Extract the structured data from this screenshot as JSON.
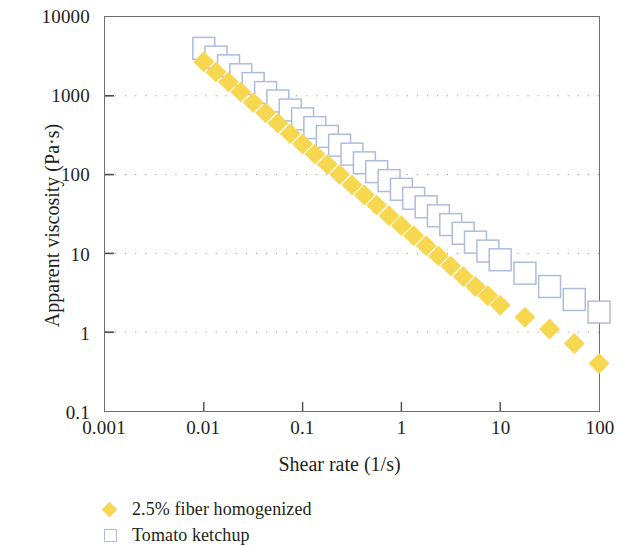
{
  "chart_data": {
    "type": "scatter",
    "title": "",
    "xlabel": "Shear rate (1/s)",
    "ylabel": "Apparent viscosity (Pa·s)",
    "xscale": "log",
    "yscale": "log",
    "xlim": [
      0.001,
      100
    ],
    "ylim": [
      0.1,
      10000
    ],
    "xticks": [
      "0.001",
      "0.01",
      "0.1",
      "1",
      "10",
      "100"
    ],
    "xtick_values": [
      0.001,
      0.01,
      0.1,
      1,
      10,
      100
    ],
    "yticks": [
      "10000",
      "1000",
      "100",
      "10",
      "1",
      "0.1"
    ],
    "ytick_values": [
      10000,
      1000,
      100,
      10,
      1,
      0.1
    ],
    "grid": "horizontal-dotted",
    "legend_position": "below-left",
    "series": [
      {
        "name": "2.5% fiber homogenized",
        "marker": "filled-diamond",
        "color": "#F7D74F",
        "x": [
          0.01,
          0.0133,
          0.0178,
          0.0237,
          0.0316,
          0.0422,
          0.0562,
          0.075,
          0.1,
          0.133,
          0.178,
          0.237,
          0.316,
          0.422,
          0.562,
          0.75,
          1.0,
          1.33,
          1.78,
          2.37,
          3.16,
          4.22,
          5.62,
          7.5,
          10.0,
          17.8,
          31.6,
          56.2,
          100.0
        ],
        "y": [
          2700,
          2000,
          1500,
          1120,
          820,
          610,
          450,
          330,
          245,
          182,
          135,
          100,
          74,
          55,
          41,
          30,
          22.5,
          16.8,
          12.5,
          9.3,
          6.9,
          5.1,
          3.8,
          2.9,
          2.2,
          1.55,
          1.1,
          0.72,
          0.4
        ]
      },
      {
        "name": "Tomato ketchup",
        "marker": "open-square",
        "color": "#AEBBDD",
        "x": [
          0.01,
          0.0133,
          0.0178,
          0.0237,
          0.0316,
          0.0422,
          0.0562,
          0.075,
          0.1,
          0.133,
          0.178,
          0.237,
          0.316,
          0.422,
          0.562,
          0.75,
          1.0,
          1.33,
          1.78,
          2.37,
          3.16,
          4.22,
          5.62,
          7.5,
          10.0,
          17.8,
          31.6,
          56.2,
          100.0
        ],
        "y": [
          4000,
          3100,
          2400,
          1850,
          1430,
          1100,
          860,
          660,
          510,
          395,
          305,
          236,
          182,
          141,
          109,
          84,
          65,
          50,
          39,
          30,
          23.2,
          18.0,
          13.9,
          10.7,
          8.3,
          5.6,
          3.8,
          2.6,
          1.8
        ]
      }
    ]
  },
  "axes": {
    "y_title": "Apparent viscosity (Pa·s)",
    "x_title": "Shear rate (1/s)"
  },
  "legend": {
    "items": [
      {
        "label": "2.5% fiber homogenized",
        "marker": "filled-diamond",
        "color": "#F7D74F"
      },
      {
        "label": "Tomato ketchup",
        "marker": "open-square",
        "color": "#AEBBDD"
      }
    ]
  }
}
